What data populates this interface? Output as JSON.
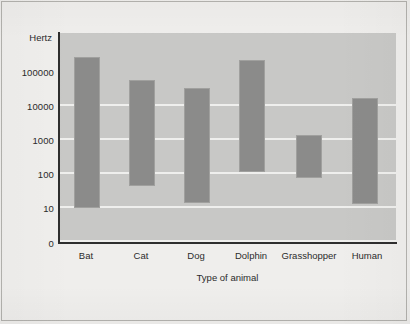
{
  "chart_data": {
    "type": "bar",
    "title": "",
    "subtitle": "",
    "xlabel": "Type of animal",
    "ylabel": "Hertz",
    "yscale": "log",
    "ylim": [
      10,
      300000
    ],
    "y_ticks": [
      "0",
      "10",
      "100",
      "1000",
      "10000",
      "100000"
    ],
    "y_tick_values": [
      0,
      10,
      100,
      1000,
      10000,
      100000
    ],
    "grid": true,
    "legend": "none",
    "orientation": "vertical",
    "bar_style": "floating range bars (low–high hearing range)",
    "categories": [
      "Bat",
      "Cat",
      "Dog",
      "Dolphin",
      "Grasshopper",
      "Human"
    ],
    "series": [
      {
        "name": "Lowest audible frequency (Hz)",
        "values": [
          10,
          45,
          15,
          110,
          75,
          13
        ]
      },
      {
        "name": "Highest audible frequency (Hz)",
        "values": [
          150000,
          40000,
          23000,
          150000,
          1100,
          13000
        ]
      }
    ],
    "bars": [
      {
        "category": "Bat",
        "low": 10,
        "high": 150000
      },
      {
        "category": "Cat",
        "low": 45,
        "high": 40000
      },
      {
        "category": "Dog",
        "low": 15,
        "high": 23000
      },
      {
        "category": "Dolphin",
        "low": 110,
        "high": 150000
      },
      {
        "category": "Grasshopper",
        "low": 75,
        "high": 1100
      },
      {
        "category": "Human",
        "low": 13,
        "high": 13000
      }
    ],
    "colors": {
      "bar_fill": "#8b8b8a",
      "plot_background": "#c8c8c6",
      "page_background": "#efeeec",
      "gridline": "#efefed",
      "axis": "#2e2e2e",
      "text": "#2b2b2b"
    }
  },
  "axes": {
    "y_title": "Hertz",
    "x_title": "Type of animal",
    "y_ticks": [
      {
        "label": "100000",
        "top": 67
      },
      {
        "label": "10000",
        "top": 101
      },
      {
        "label": "1000",
        "top": 135
      },
      {
        "label": "100",
        "top": 169
      },
      {
        "label": "10",
        "top": 203
      },
      {
        "label": "0",
        "top": 238
      }
    ],
    "x_ticks": [
      {
        "label": "Bat",
        "center": 27
      },
      {
        "label": "Cat",
        "center": 82
      },
      {
        "label": "Dog",
        "center": 137
      },
      {
        "label": "Dolphin",
        "center": 192
      },
      {
        "label": "Grasshopper",
        "center": 250
      },
      {
        "label": "Human",
        "center": 308
      }
    ]
  },
  "render": {
    "gridlines_top": [
      71,
      105,
      139,
      173,
      207
    ],
    "bars_px": [
      {
        "name": "Bat",
        "left": 15,
        "width": 26,
        "top": 24,
        "height": 151
      },
      {
        "name": "Cat",
        "left": 70,
        "width": 26,
        "top": 47,
        "height": 106
      },
      {
        "name": "Dog",
        "left": 125,
        "width": 26,
        "top": 55,
        "height": 115
      },
      {
        "name": "Dolphin",
        "left": 180,
        "width": 26,
        "top": 27,
        "height": 112
      },
      {
        "name": "Grasshopper",
        "left": 237,
        "width": 26,
        "top": 102,
        "height": 43
      },
      {
        "name": "Human",
        "left": 293,
        "width": 26,
        "top": 65,
        "height": 106
      }
    ]
  }
}
